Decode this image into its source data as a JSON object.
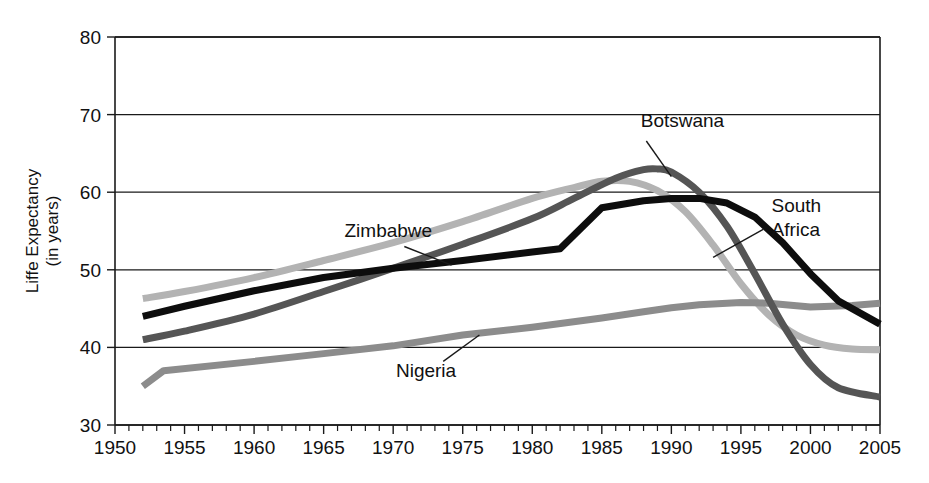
{
  "chart_data": {
    "type": "line",
    "title": "",
    "xlabel": "",
    "ylabel": "Liffe Expectancy\n(in years)",
    "ylabel_line1": "Liffe Expectancy",
    "ylabel_line2": "(in years)",
    "xlim": [
      1950,
      2005
    ],
    "ylim": [
      30,
      80
    ],
    "x_ticks": [
      1950,
      1955,
      1960,
      1965,
      1970,
      1975,
      1980,
      1985,
      1990,
      1995,
      2000,
      2005
    ],
    "x_tick_labels": [
      "1950",
      "1955",
      "1960",
      "1965",
      "1970",
      "1975",
      "1980",
      "1985",
      "1990",
      "1995",
      "2000",
      "2005"
    ],
    "y_ticks": [
      30,
      40,
      50,
      60,
      70,
      80
    ],
    "y_tick_labels": [
      "30",
      "40",
      "50",
      "60",
      "70",
      "80"
    ],
    "x_minor_tick_interval": 1,
    "grid": "horizontal",
    "legend_position": "inline-annotations",
    "series": [
      {
        "name": "Zimbabwe",
        "color": "#b3b3b3",
        "stroke_width": 7,
        "label_x": 1966.5,
        "label_y": 54.2,
        "leader_from": [
          1970.8,
          53.0
        ],
        "leader_to": [
          1974.2,
          50.6
        ],
        "x": [
          1952,
          1955,
          1960,
          1965,
          1970,
          1975,
          1980,
          1983,
          1985,
          1987,
          1989,
          1991,
          1993,
          1995,
          1997,
          1999,
          2001,
          2003,
          2005
        ],
        "values": [
          46.3,
          47.2,
          49.0,
          51.2,
          53.5,
          56.2,
          59.2,
          60.6,
          61.4,
          61.4,
          60.2,
          57.5,
          53.2,
          48.2,
          44.2,
          41.6,
          40.3,
          39.8,
          39.7
        ]
      },
      {
        "name": "South Africa",
        "color": "#0d0d0d",
        "stroke_width": 7,
        "label_x": 1997.2,
        "label_y": 57.5,
        "label_line1": "South",
        "label_line2": "Africa",
        "leader_from": [
          1996.6,
          55.2
        ],
        "leader_to": [
          1993.0,
          51.6
        ],
        "x": [
          1952,
          1955,
          1960,
          1965,
          1970,
          1975,
          1980,
          1982,
          1985,
          1988,
          1990,
          1992,
          1994,
          1996,
          1998,
          2000,
          2002,
          2005
        ],
        "values": [
          44.0,
          45.3,
          47.3,
          49.0,
          50.2,
          51.2,
          52.3,
          52.7,
          58.0,
          58.9,
          59.2,
          59.2,
          58.6,
          56.8,
          53.5,
          49.5,
          46.0,
          43.0
        ]
      },
      {
        "name": "Botswana",
        "color": "#555555",
        "stroke_width": 7,
        "label_x": 1987.8,
        "label_y": 68.4,
        "leader_from": [
          1988.2,
          66.6
        ],
        "leader_to": [
          1990.0,
          62.0
        ],
        "x": [
          1952,
          1955,
          1960,
          1965,
          1970,
          1975,
          1980,
          1983,
          1986,
          1988,
          1989,
          1990,
          1992,
          1994,
          1996,
          1998,
          2000,
          2002,
          2005
        ],
        "values": [
          41.0,
          42.1,
          44.3,
          47.2,
          50.2,
          53.3,
          56.6,
          59.2,
          61.8,
          62.9,
          63.0,
          62.6,
          60.0,
          55.6,
          49.5,
          43.0,
          37.8,
          34.8,
          33.6
        ]
      },
      {
        "name": "Nigeria",
        "color": "#8c8c8c",
        "stroke_width": 7,
        "label_x": 1970.2,
        "label_y": 36.2,
        "leader_from": [
          1973.6,
          38.2
        ],
        "leader_to": [
          1976.2,
          41.6
        ],
        "x": [
          1952,
          1953.5,
          1960,
          1965,
          1970,
          1975,
          1980,
          1985,
          1988,
          1990,
          1992,
          1995,
          1997,
          2000,
          2003,
          2005
        ],
        "values": [
          35.0,
          37.0,
          38.2,
          39.2,
          40.2,
          41.6,
          42.6,
          43.8,
          44.6,
          45.1,
          45.5,
          45.8,
          45.7,
          45.2,
          45.4,
          45.7
        ]
      }
    ]
  },
  "plot_geometry": {
    "left": 115,
    "right": 880,
    "top": 37,
    "bottom": 425
  }
}
